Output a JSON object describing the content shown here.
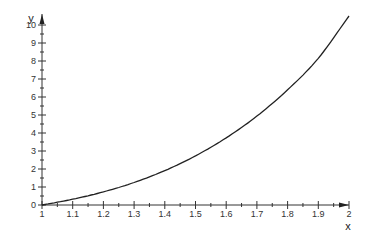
{
  "chart_data": {
    "type": "line",
    "title": "",
    "xlabel": "x",
    "ylabel": "y",
    "xlim": [
      1,
      2
    ],
    "ylim": [
      0,
      10
    ],
    "grid": false,
    "legend": null,
    "x_ticks": [
      "1",
      "1.1",
      "1.2",
      "1.3",
      "1.4",
      "1.5",
      "1.6",
      "1.7",
      "1.8",
      "1.9",
      "2"
    ],
    "y_ticks": [
      "0",
      "1",
      "2",
      "3",
      "4",
      "5",
      "6",
      "7",
      "8",
      "9",
      "10"
    ],
    "series": [
      {
        "name": "y",
        "color": "#222222",
        "x": [
          1.0,
          1.1,
          1.2,
          1.3,
          1.4,
          1.5,
          1.6,
          1.7,
          1.8,
          1.9,
          2.0
        ],
        "values": [
          0,
          0.32,
          0.73,
          1.25,
          1.91,
          2.73,
          3.73,
          4.94,
          6.4,
          8.15,
          10.5
        ]
      }
    ]
  }
}
